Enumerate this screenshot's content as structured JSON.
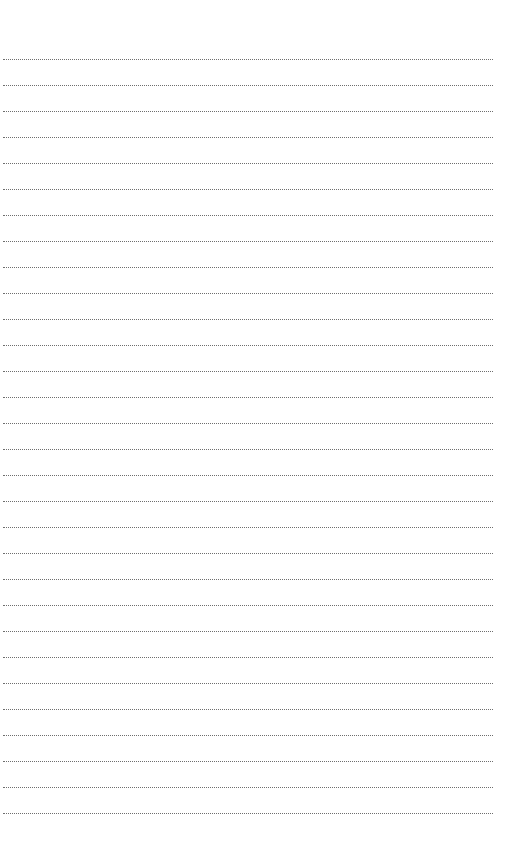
{
  "page": {
    "type": "blank lined notebook page",
    "background_color": "#ffffff",
    "rule_color": "#6e6e6e",
    "rule_style": "dotted",
    "rule_count": 30,
    "first_rule_y": 59,
    "rule_spacing": 26,
    "rule_left": 3,
    "rule_width": 490
  }
}
